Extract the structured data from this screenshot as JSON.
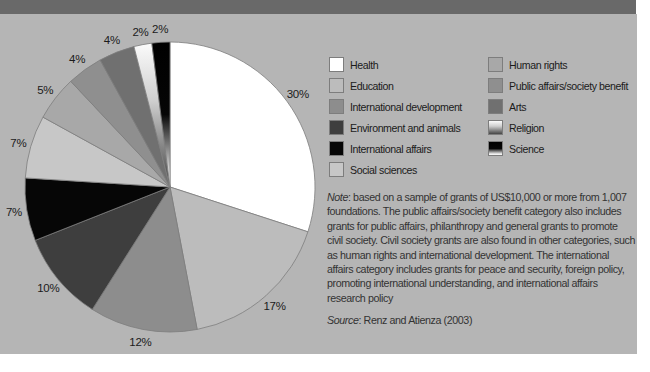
{
  "colors": {
    "top_bar": "#696969",
    "panel_bg": "#b5b5b5",
    "slice_stroke": "#7d7d7d",
    "label_color": "#1b1b1b"
  },
  "chart_data": {
    "type": "pie",
    "title": "",
    "categories": [
      "Health",
      "Education",
      "International development",
      "Environment and animals",
      "International affairs",
      "Social sciences",
      "Human rights",
      "Public affairs/society benefit",
      "Arts",
      "Religion",
      "Science"
    ],
    "values": [
      30,
      17,
      12,
      10,
      7,
      7,
      5,
      4,
      4,
      2,
      2
    ],
    "labels": [
      "30%",
      "17%",
      "12%",
      "10%",
      "7%",
      "7%",
      "5%",
      "4%",
      "4%",
      "2%",
      "2%"
    ],
    "colors": [
      "#ffffff",
      "#bcbcbc",
      "#8d8d8d",
      "#3e3e3e",
      "#060606",
      "#c7c7c7",
      "#a8a8a8",
      "#8f8f8f",
      "#707070",
      "religion-gradient",
      "science-gradient"
    ],
    "gradients": {
      "religion-gradient": [
        {
          "o": 0,
          "c": "#fbfbfb"
        },
        {
          "o": 0.4,
          "c": "#cfcfcf"
        },
        {
          "o": 1,
          "c": "#454545"
        }
      ],
      "science-gradient": [
        {
          "o": 0,
          "c": "#000000"
        },
        {
          "o": 0.5,
          "c": "#060606"
        },
        {
          "o": 0.88,
          "c": "#d9d9d9"
        },
        {
          "o": 1,
          "c": "#ffffff"
        }
      ]
    },
    "start_angle_deg": 0,
    "direction": "clockwise",
    "legend_position": "right",
    "legend_columns": [
      [
        0,
        1,
        2,
        3,
        4,
        5
      ],
      [
        6,
        7,
        8,
        9,
        10
      ]
    ]
  },
  "note": {
    "label": "Note",
    "body": ": based on a sample of grants of US$10,000 or more from 1,007 foundations. The public affairs/society benefit category also includes grants for public affairs, philanthropy and general grants to promote civil society. Civil society grants are also found in other categories, such as human rights and international development. The international affairs category includes grants for peace and security, foreign policy, promoting international understanding, and international affairs research policy"
  },
  "source": {
    "label": "Source",
    "body": ": Renz and Atienza (2003)"
  }
}
